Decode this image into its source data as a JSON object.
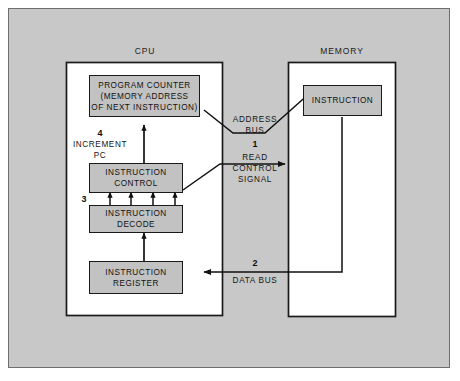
{
  "figure": {
    "background_color": "#c8c8c8",
    "frame_color": "#6e6e6e",
    "box_fill": "#c2c2c2",
    "line_color": "#1a1a1a"
  },
  "units": [
    {
      "id": "cpu",
      "title": "CPU"
    },
    {
      "id": "memory",
      "title": "MEMORY"
    }
  ],
  "cpu": {
    "title": "CPU",
    "blocks": [
      {
        "id": "program-counter",
        "lines": [
          "PROGRAM COUNTER",
          "(MEMORY ADDRESS",
          "OF NEXT INSTRUCTION)"
        ]
      },
      {
        "id": "instruction-control",
        "lines": [
          "INSTRUCTION",
          "CONTROL"
        ]
      },
      {
        "id": "instruction-decode",
        "lines": [
          "INSTRUCTION",
          "DECODE"
        ]
      },
      {
        "id": "instruction-register",
        "lines": [
          "INSTRUCTION",
          "REGISTER"
        ]
      }
    ],
    "increment_label": {
      "number": "4",
      "lines": [
        "INCREMENT",
        "PC"
      ]
    },
    "decode_step": {
      "number": "3"
    }
  },
  "memory": {
    "title": "MEMORY",
    "blocks": [
      {
        "id": "instruction-cell",
        "lines": [
          "INSTRUCTION"
        ]
      }
    ]
  },
  "buses": [
    {
      "id": "address-bus",
      "lines": [
        "ADDRESS",
        "BUS"
      ],
      "number": null
    },
    {
      "id": "read-control-signal",
      "number": "1",
      "lines": [
        "READ",
        "CONTROL",
        "SIGNAL"
      ]
    },
    {
      "id": "data-bus",
      "number": "2",
      "lines": [
        "DATA BUS"
      ]
    }
  ]
}
